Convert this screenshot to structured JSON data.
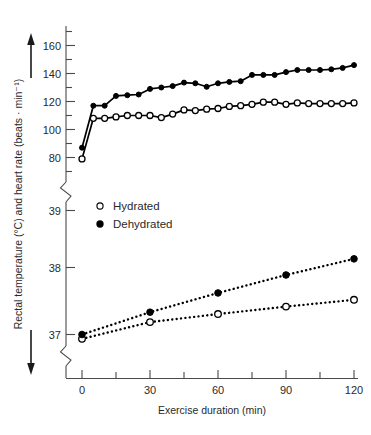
{
  "chart_data": {
    "type": "line",
    "title": "",
    "xlabel": "Exercise duration (min)",
    "ylabel": "Rectal temperature (°C) and heart rate (beats · min⁻¹)",
    "grid": false,
    "legend_position": "upper-left-inside",
    "axis_breaks": 2,
    "x": {
      "min": 0,
      "max": 125,
      "ticks": [
        0,
        30,
        60,
        90,
        120
      ],
      "tick_labels": [
        "0",
        "30",
        "60",
        "90",
        "120"
      ],
      "minor_tick_interval": 15
    },
    "y_upper": {
      "name": "heart rate (beats · min⁻¹)",
      "min": 70,
      "max": 170,
      "ticks": [
        80,
        100,
        120,
        140,
        160
      ],
      "tick_labels": [
        "80",
        "100",
        "120",
        "140",
        "160"
      ],
      "minor_tick_interval": 10
    },
    "y_lower": {
      "name": "rectal temperature (°C)",
      "min": 36.6,
      "max": 39.3,
      "ticks": [
        37,
        38,
        39
      ],
      "tick_labels": [
        "37",
        "38",
        "39"
      ]
    },
    "series": [
      {
        "name": "Hydrated",
        "measure": "heart rate",
        "marker": "open-circle",
        "linestyle": "solid",
        "axis": "y_upper",
        "x": [
          0,
          5,
          10,
          15,
          20,
          25,
          30,
          35,
          40,
          45,
          50,
          55,
          60,
          65,
          70,
          75,
          80,
          85,
          90,
          95,
          100,
          105,
          110,
          115,
          120
        ],
        "values": [
          79,
          108,
          108,
          109,
          110,
          110,
          110,
          108.5,
          111,
          114,
          113.5,
          114.5,
          115,
          116.5,
          117,
          118,
          119.5,
          119.5,
          118,
          119,
          118.5,
          118.5,
          118.5,
          118.5,
          119
        ]
      },
      {
        "name": "Dehydrated",
        "measure": "heart rate",
        "marker": "filled-circle",
        "linestyle": "solid",
        "axis": "y_upper",
        "x": [
          0,
          5,
          10,
          15,
          20,
          25,
          30,
          35,
          40,
          45,
          50,
          55,
          60,
          65,
          70,
          75,
          80,
          85,
          90,
          95,
          100,
          105,
          110,
          115,
          120
        ],
        "values": [
          87,
          117,
          117,
          124,
          124.5,
          125,
          129,
          130,
          131,
          133.5,
          133,
          130.5,
          133,
          134,
          134.5,
          139,
          139,
          139,
          141,
          142.5,
          142.5,
          142.5,
          143,
          144,
          146
        ]
      },
      {
        "name": "Hydrated",
        "measure": "rectal temperature",
        "marker": "open-circle",
        "linestyle": "dotted",
        "axis": "y_lower",
        "x": [
          0,
          30,
          60,
          90,
          120
        ],
        "values": [
          36.93,
          37.2,
          37.33,
          37.45,
          37.56
        ]
      },
      {
        "name": "Dehydrated",
        "measure": "rectal temperature",
        "marker": "filled-circle",
        "linestyle": "dotted",
        "axis": "y_lower",
        "x": [
          0,
          30,
          60,
          90,
          120
        ],
        "values": [
          37.0,
          37.36,
          37.67,
          37.96,
          38.22
        ]
      }
    ],
    "legend": [
      {
        "label": "Hydrated",
        "marker": "open-circle"
      },
      {
        "label": "Dehydrated",
        "marker": "filled-circle"
      }
    ],
    "colors": {
      "line": "#000000",
      "marker_fill_open": "#ffffff",
      "marker_fill_filled": "#000000",
      "axis": "#4a4a4a",
      "text": "#2a2a2a"
    }
  }
}
